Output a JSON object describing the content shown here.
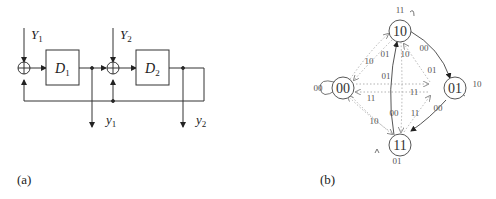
{
  "panel_a": {
    "caption": "(a)",
    "inputs": {
      "Y1": "Y",
      "Y1_sub": "1",
      "Y2": "Y",
      "Y2_sub": "2"
    },
    "delays": {
      "D1": "D",
      "D1_sub": "1",
      "D2": "D",
      "D2_sub": "2"
    },
    "outputs": {
      "y1": "y",
      "y1_sub": "1",
      "y2": "y",
      "y2_sub": "2"
    },
    "adder_symbol": "+"
  },
  "panel_b": {
    "caption": "(b)",
    "states": [
      "00",
      "01",
      "10",
      "11"
    ],
    "self_loops": {
      "s00": "00",
      "s01": "10",
      "s10": "11",
      "s11": "01"
    },
    "edge_labels": {
      "s10_to_s01": "00",
      "s01_to_s11": "00",
      "s11_to_s10": "00",
      "s00_to_s10": "10",
      "s10_to_s00": "01",
      "s10_to_s11": "10",
      "s01_to_s10": "01",
      "s00_to_s01": "01",
      "s01_to_s00": "11",
      "s00_to_s11": "11",
      "s11_to_s00": "10",
      "s11_to_s01": "11"
    }
  }
}
